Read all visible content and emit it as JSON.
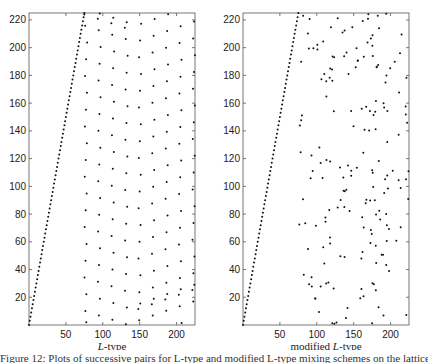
{
  "chart_data": [
    {
      "type": "scatter",
      "title": "",
      "xlabel": "L-type",
      "ylabel": "",
      "xlim": [
        0,
        225
      ],
      "ylim": [
        0,
        225
      ],
      "xticks": [
        50,
        100,
        150,
        200
      ],
      "yticks": [
        20,
        40,
        60,
        80,
        100,
        120,
        140,
        160,
        180,
        200,
        220
      ],
      "grid": false,
      "series": [
        {
          "name": "diagonal",
          "description": "dense dotted line from (0,0) to (75,225), slope 3"
        },
        {
          "name": "lattice",
          "description": "regular lattice of points in chevron pattern for x in ~75..225"
        }
      ]
    },
    {
      "type": "scatter",
      "title": "",
      "xlabel": "modified L-type",
      "ylabel": "",
      "xlim": [
        0,
        225
      ],
      "ylim": [
        0,
        225
      ],
      "xticks": [
        50,
        100,
        150,
        200
      ],
      "yticks": [
        20,
        40,
        60,
        80,
        100,
        120,
        140,
        160,
        180,
        200,
        220
      ],
      "grid": false,
      "series": [
        {
          "name": "diagonal",
          "description": "dense dotted line from (0,0) to (75,225), slope 3"
        },
        {
          "name": "scattered",
          "description": "irregularly scattered points for x in ~75..225"
        }
      ]
    }
  ],
  "left": {
    "xlabel_italic": "L",
    "xlabel_rest": "-type"
  },
  "right": {
    "xlabel_prefix": "modified ",
    "xlabel_italic": "L",
    "xlabel_rest": "-type"
  },
  "ticks": {
    "x": [
      "50",
      "100",
      "150",
      "200"
    ],
    "y": [
      "20",
      "40",
      "60",
      "80",
      "100",
      "120",
      "140",
      "160",
      "180",
      "200",
      "220"
    ]
  },
  "caption": "Figure 12: Plots of successive pairs for L-type and modified L-type mixing schemes on the lattice for p = 227"
}
